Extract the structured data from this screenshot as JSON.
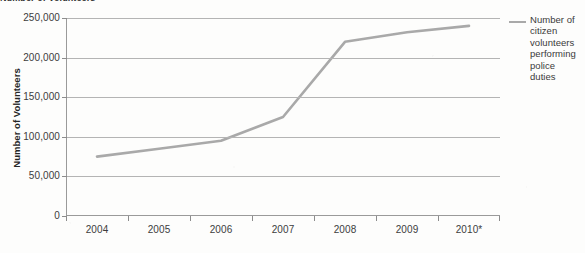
{
  "figure": {
    "clipped_title": "Number of Volunteers",
    "background_color": "#fdfdfc"
  },
  "chart_data": {
    "type": "line",
    "title": "",
    "xlabel": "",
    "ylabel": "Number of Volunteers",
    "categories": [
      "2004",
      "2005",
      "2006",
      "2007",
      "2008",
      "2009",
      "2010*"
    ],
    "series": [
      {
        "name": "Number of citizen volunteers performing police duties",
        "color": "#a9a9a9",
        "values": [
          75000,
          85000,
          95000,
          125000,
          220000,
          232000,
          240000
        ]
      }
    ],
    "ylim": [
      0,
      250000
    ],
    "yticks": [
      0,
      50000,
      100000,
      150000,
      200000,
      250000
    ],
    "ytick_labels": [
      "0",
      "50,000",
      "100,000",
      "150,000",
      "200,000",
      "250,000"
    ],
    "grid": true,
    "legend_position": "right"
  },
  "legend": {
    "entries": [
      {
        "label": "Number of citizen volunteers performing police duties",
        "color": "#a9a9a9"
      }
    ]
  }
}
